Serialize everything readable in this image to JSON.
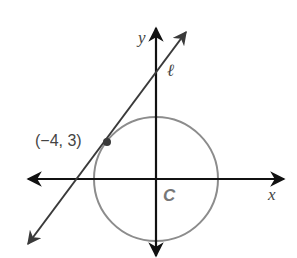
{
  "diagram": {
    "type": "coordinate-geometry",
    "axes": {
      "x_label": "x",
      "y_label": "y"
    },
    "circle": {
      "label": "C",
      "center": [
        0,
        0
      ],
      "radius": 5,
      "stroke_color": "#8c8c8c"
    },
    "line": {
      "label": "ℓ",
      "stroke_color": "#3a3a3a",
      "tangent_to_circle": true
    },
    "point": {
      "label": "(−4, 3)",
      "coords": [
        -4,
        3
      ],
      "fill_color": "#3a3a3a"
    },
    "colors": {
      "axis": "#111111",
      "label_text": "#444444"
    }
  }
}
